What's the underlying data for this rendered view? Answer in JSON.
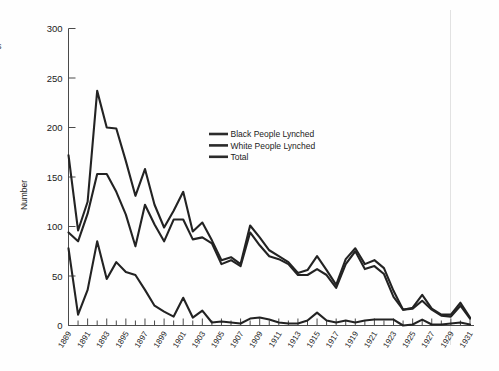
{
  "chart_data": {
    "type": "line",
    "title": "",
    "xlabel": "",
    "ylabel": "Number",
    "ylim": [
      0,
      300
    ],
    "yticks": [
      0,
      50,
      100,
      150,
      200,
      250,
      300
    ],
    "grid": false,
    "legend_position": "center",
    "x": [
      1889,
      1890,
      1891,
      1892,
      1893,
      1894,
      1895,
      1896,
      1897,
      1898,
      1899,
      1900,
      1901,
      1902,
      1903,
      1904,
      1905,
      1906,
      1907,
      1908,
      1909,
      1910,
      1911,
      1912,
      1913,
      1914,
      1915,
      1916,
      1917,
      1918,
      1919,
      1920,
      1921,
      1922,
      1923,
      1924,
      1925,
      1926,
      1927,
      1928,
      1929,
      1930,
      1931
    ],
    "xtick_labels": [
      "1889",
      "1891",
      "1893",
      "1895",
      "1897",
      "1899",
      "1901",
      "1903",
      "1905",
      "1907",
      "1909",
      "1911",
      "1913",
      "1915",
      "1917",
      "1919",
      "1921",
      "1923",
      "1925",
      "1927",
      "1929",
      "1931"
    ],
    "series": [
      {
        "name": "Total",
        "values": [
          172,
          96,
          125,
          237,
          200,
          199,
          166,
          131,
          158,
          122,
          99,
          116,
          135,
          95,
          104,
          86,
          66,
          69,
          62,
          101,
          89,
          76,
          70,
          64,
          53,
          56,
          70,
          56,
          41,
          67,
          78,
          62,
          66,
          58,
          35,
          16,
          18,
          31,
          17,
          11,
          11,
          23,
          8
        ]
      },
      {
        "name": "Black People Lynched",
        "values": [
          94,
          85,
          113,
          153,
          153,
          135,
          112,
          80,
          122,
          102,
          85,
          107,
          107,
          87,
          89,
          83,
          62,
          66,
          60,
          94,
          81,
          70,
          67,
          62,
          51,
          51,
          57,
          51,
          38,
          62,
          75,
          57,
          60,
          52,
          29,
          16,
          17,
          25,
          16,
          10,
          9,
          20,
          7
        ]
      },
      {
        "name": "White People Lynched",
        "values": [
          78,
          11,
          36,
          85,
          47,
          64,
          54,
          51,
          36,
          20,
          14,
          9,
          28,
          8,
          15,
          3,
          4,
          3,
          2,
          7,
          8,
          6,
          3,
          2,
          2,
          5,
          13,
          5,
          3,
          5,
          3,
          5,
          6,
          6,
          6,
          0,
          1,
          6,
          1,
          1,
          2,
          3,
          1
        ]
      }
    ]
  },
  "legend": {
    "entries": [
      {
        "label": "Black People Lynched",
        "color": "#2b2b2b"
      },
      {
        "label": "White People Lynched",
        "color": "#2b2b2b"
      },
      {
        "label": "Total",
        "color": "#2b2b2b"
      }
    ]
  },
  "axes": {
    "y_title": "Number",
    "y_ticks": [
      "300",
      "250",
      "200",
      "150",
      "100",
      "50",
      "0"
    ],
    "x_ticks": [
      "1889",
      "1891",
      "1893",
      "1895",
      "1897",
      "1899",
      "1901",
      "1903",
      "1905",
      "1907",
      "1909",
      "1911",
      "1913",
      "1915",
      "1917",
      "1919",
      "1921",
      "1923",
      "1925",
      "1927",
      "1929",
      "1931"
    ]
  },
  "artifacts": {
    "left_edge_fragment": "s"
  },
  "colors": {
    "line": "#232323",
    "axis": "#4a4a4a",
    "background": "#fefefe",
    "scan_line": "#e2e2e2"
  }
}
